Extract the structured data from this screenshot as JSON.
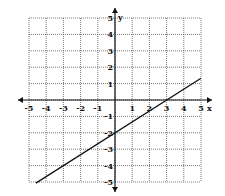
{
  "chart_data": {
    "type": "line",
    "title": "",
    "xlabel": "x",
    "ylabel": "y",
    "xlim": [
      -5,
      5
    ],
    "ylim": [
      -5,
      5
    ],
    "grid": true,
    "x_ticks": [
      "-5",
      "-4",
      "-3",
      "-2",
      "-1",
      "1",
      "2",
      "3",
      "4",
      "5"
    ],
    "y_ticks": [
      "5",
      "4",
      "3",
      "2",
      "1",
      "-1",
      "-2",
      "-3",
      "-4",
      "-5"
    ],
    "series": [
      {
        "name": "line",
        "equation": "y = (2/3)x - 2",
        "slope": 0.6667,
        "intercept": -2,
        "x": [
          -4.6,
          0,
          3,
          5
        ],
        "y": [
          -5.07,
          -2,
          0,
          1.33
        ]
      }
    ]
  }
}
